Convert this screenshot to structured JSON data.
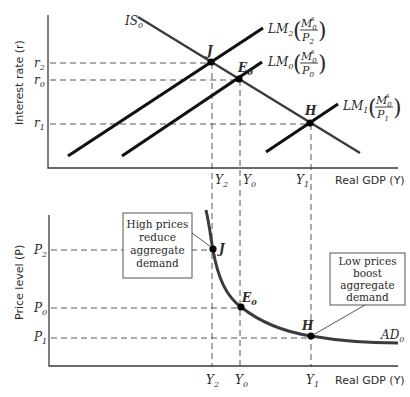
{
  "top_panel": {
    "y_axis_label": "Interest rate (r)",
    "x_axis_label": "Real GDP (Y)",
    "is_curve": {
      "label": "IS",
      "sub": "0"
    },
    "lm_curves": [
      {
        "id": "lm2",
        "label": "LM",
        "sub": "2",
        "num": "M",
        "num_sub": "0",
        "num_sup": "s",
        "den": "P",
        "den_sub": "2"
      },
      {
        "id": "lm0",
        "label": "LM",
        "sub": "0",
        "num": "M",
        "num_sub": "0",
        "num_sup": "s",
        "den": "P",
        "den_sub": "0"
      },
      {
        "id": "lm1",
        "label": "LM",
        "sub": "1",
        "num": "M",
        "num_sub": "0",
        "num_sup": "s",
        "den": "P",
        "den_sub": "1"
      }
    ],
    "y_ticks": [
      {
        "label": "r",
        "sub": "2"
      },
      {
        "label": "r",
        "sub": "0"
      },
      {
        "label": "r",
        "sub": "1"
      }
    ],
    "x_ticks": [
      {
        "label": "Y",
        "sub": "2"
      },
      {
        "label": "Y",
        "sub": "0"
      },
      {
        "label": "Y",
        "sub": "1"
      }
    ],
    "points": [
      {
        "label": "J",
        "sub": ""
      },
      {
        "label": "E",
        "sub": "0"
      },
      {
        "label": "H",
        "sub": ""
      }
    ]
  },
  "bottom_panel": {
    "y_axis_label": "Price level (P)",
    "x_axis_label": "Real GDP (Y)",
    "ad_curve": {
      "label": "AD",
      "sub": "0"
    },
    "y_ticks": [
      {
        "label": "P",
        "sub": "2"
      },
      {
        "label": "P",
        "sub": "0"
      },
      {
        "label": "P",
        "sub": "1"
      }
    ],
    "x_ticks": [
      {
        "label": "Y",
        "sub": "2"
      },
      {
        "label": "Y",
        "sub": "0"
      },
      {
        "label": "Y",
        "sub": "1"
      }
    ],
    "points": [
      {
        "label": "J",
        "sub": ""
      },
      {
        "label": "E",
        "sub": "0"
      },
      {
        "label": "H",
        "sub": ""
      }
    ],
    "callouts": [
      {
        "lines": [
          "High prices",
          "reduce",
          "aggregate",
          "demand"
        ]
      },
      {
        "lines": [
          "Low prices",
          "boost",
          "aggregate",
          "demand"
        ]
      }
    ]
  }
}
